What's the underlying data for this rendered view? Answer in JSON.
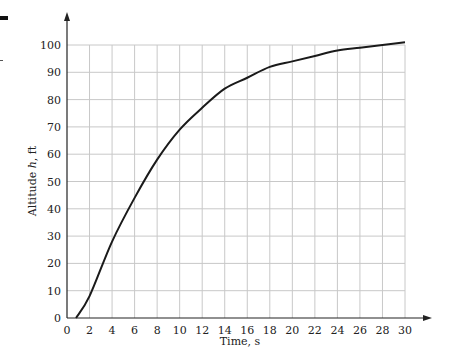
{
  "chart_data": {
    "type": "line",
    "title": "",
    "xlabel": "Time, s",
    "ylabel": "Altitude h, ft",
    "xlim": [
      0,
      30
    ],
    "ylim": [
      0,
      100
    ],
    "grid": true,
    "legend": null,
    "x_ticks": [
      0,
      2,
      4,
      6,
      8,
      10,
      12,
      14,
      16,
      18,
      20,
      22,
      24,
      26,
      28,
      30
    ],
    "y_ticks": [
      0,
      10,
      20,
      30,
      40,
      50,
      60,
      70,
      80,
      90,
      100
    ],
    "series": [
      {
        "name": "Altitude",
        "x": [
          0.8,
          2,
          4,
          6,
          8,
          10,
          12,
          14,
          16,
          18,
          20,
          22,
          24,
          26,
          28,
          30
        ],
        "values": [
          0,
          8,
          28,
          44,
          58,
          69,
          77,
          84,
          88,
          92,
          94,
          96,
          98,
          99,
          100,
          101
        ]
      }
    ]
  },
  "labels": {
    "x_axis": "Time, s",
    "y_axis_prefix": "Altitude ",
    "y_axis_var": "h",
    "y_axis_suffix": ", ft"
  }
}
